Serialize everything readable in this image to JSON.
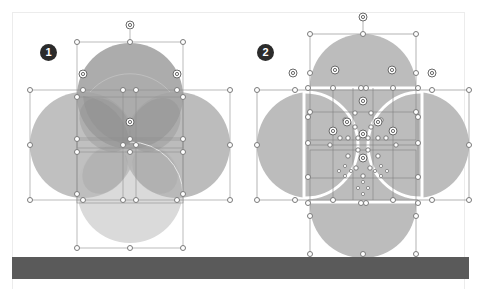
{
  "panels": [
    {
      "badge": "1",
      "label": "overlapping-circles-selected"
    },
    {
      "badge": "2",
      "label": "fragmented-circles-selected"
    }
  ],
  "colors": {
    "background": "#ffffff",
    "circle_top": "#a8a8a8",
    "circle_side": "#b8b8b8",
    "circle_bottom": "#d9d9d9",
    "overlap": "#969696",
    "panel2_fill": "#bcbcbc",
    "footer_bar": "#5a5a5a",
    "badge": "#2b2b2b",
    "handle_stroke": "#8a8a8a"
  }
}
